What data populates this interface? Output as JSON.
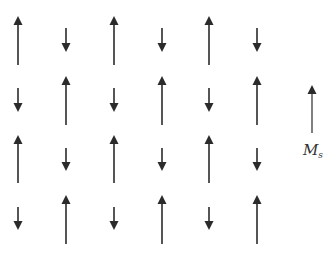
{
  "diagram": {
    "colors": {
      "arrow": "#2b2b2b",
      "background": "#ffffff",
      "label": "#333333"
    },
    "columns_x": [
      18,
      66,
      114,
      162,
      209,
      257
    ],
    "rows": [
      {
        "long_top": 16,
        "long_bottom": 65,
        "short_top": 28,
        "short_bottom": 52,
        "pattern": [
          "up",
          "down",
          "up",
          "down",
          "up",
          "down"
        ]
      },
      {
        "long_top": 76,
        "long_bottom": 125,
        "short_top": 88,
        "short_bottom": 112,
        "pattern": [
          "down",
          "up",
          "down",
          "up",
          "down",
          "up"
        ]
      },
      {
        "long_top": 135,
        "long_bottom": 183,
        "short_top": 148,
        "short_bottom": 171,
        "pattern": [
          "up",
          "down",
          "up",
          "down",
          "up",
          "down"
        ]
      },
      {
        "long_top": 195,
        "long_bottom": 244,
        "short_top": 207,
        "short_bottom": 230,
        "pattern": [
          "down",
          "up",
          "down",
          "up",
          "down",
          "up"
        ]
      }
    ],
    "net_magnetization": {
      "x": 312,
      "top": 85,
      "bottom": 133,
      "label_main": "M",
      "label_sub": "s"
    }
  }
}
